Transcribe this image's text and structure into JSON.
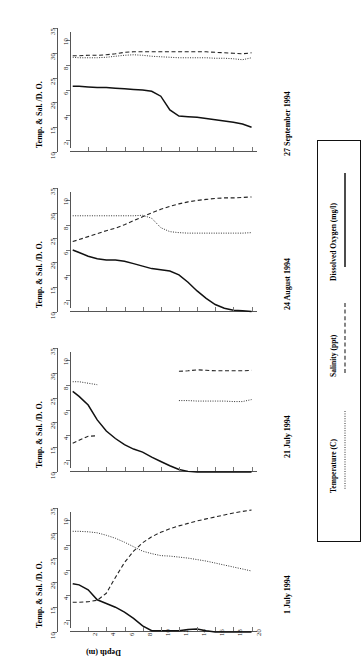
{
  "figure": {
    "y_axis_title": "Temp. & Sal. /D. O.",
    "x_axis_title": "Depth (m)",
    "orientation": "rotated-90",
    "outer_axis_ticks": [
      "10",
      "15",
      "20",
      "25",
      "30",
      "35"
    ],
    "inner_axis_ticks": [
      "2",
      "4",
      "6",
      "8",
      "10"
    ],
    "depth_ticks": [
      "2",
      "4",
      "6",
      "8",
      "10",
      "12",
      "14",
      "16",
      "18",
      "20"
    ]
  },
  "legend": {
    "title": "",
    "items": [
      {
        "label": "Dissolved Oxygen (mg/l)",
        "style": "solid",
        "color": "#111111"
      },
      {
        "label": "Salinity (ppt)",
        "style": "dashed",
        "color": "#222222"
      },
      {
        "label": "Temperature (C)",
        "style": "dotted",
        "color": "#333333"
      }
    ]
  },
  "panels": [
    {
      "date": "27 September 1994"
    },
    {
      "date": "24 August 1994"
    },
    {
      "date": "21 July 1994"
    },
    {
      "date": "1 July 1994"
    }
  ],
  "chart_data": {
    "type": "line",
    "title": "",
    "xlabel": "Depth (m)",
    "ylabel": "Temp. & Sal. /D. O.",
    "xlim": [
      0,
      20
    ],
    "ylim_outer": [
      10,
      35
    ],
    "ylim_inner": [
      1,
      11
    ],
    "grid": false,
    "legend_position": "right",
    "note": "Four depth-profile panels (one per survey date). Dissolved Oxygen read on inner axis (mg/l, 2-10); Salinity and Temperature read on outer axis (10-35).",
    "panels": [
      {
        "date": "27 September 1994",
        "x": [
          0.3,
          1,
          2,
          3,
          4,
          5,
          6,
          7,
          8,
          9,
          10,
          11,
          12,
          13,
          14,
          15,
          16,
          17,
          18,
          19,
          20
        ],
        "series": [
          {
            "name": "Dissolved Oxygen (mg/l)",
            "axis": "inner",
            "values": [
              6.3,
              6.3,
              6.25,
              6.2,
              6.2,
              6.15,
              6.1,
              6.05,
              6.0,
              5.9,
              5.5,
              4.4,
              3.9,
              3.85,
              3.8,
              3.7,
              3.6,
              3.5,
              3.4,
              3.25,
              3.0
            ]
          },
          {
            "name": "Salinity (ppt)",
            "axis": "outer",
            "values": [
              29.4,
              29.4,
              29.5,
              29.5,
              29.6,
              29.8,
              30.1,
              30.2,
              30.2,
              30.2,
              30.2,
              30.2,
              30.2,
              30.2,
              30.2,
              30.2,
              30.1,
              30.0,
              29.9,
              29.8,
              30.0
            ]
          },
          {
            "name": "Temperature (C)",
            "axis": "outer",
            "values": [
              29.1,
              29.0,
              29.0,
              29.0,
              29.1,
              29.3,
              29.5,
              29.6,
              29.5,
              29.3,
              29.2,
              29.1,
              29.0,
              29.0,
              29.0,
              29.0,
              28.9,
              28.9,
              28.8,
              28.6,
              29.0
            ]
          }
        ]
      },
      {
        "date": "24 August 1994",
        "x": [
          0.3,
          1,
          2,
          3,
          4,
          5,
          6,
          7,
          8,
          9,
          10,
          11,
          12,
          13,
          14,
          15,
          16,
          17,
          18,
          19,
          20
        ],
        "series": [
          {
            "name": "Dissolved Oxygen (mg/l)",
            "axis": "inner",
            "values": [
              6.0,
              5.8,
              5.5,
              5.3,
              5.2,
              5.2,
              5.1,
              4.9,
              4.7,
              4.5,
              4.4,
              4.3,
              4.0,
              3.4,
              2.7,
              2.1,
              1.6,
              1.3,
              1.15,
              1.1,
              1.05
            ]
          },
          {
            "name": "Salinity (ppt)",
            "axis": "outer",
            "values": [
              24.2,
              24.6,
              25.2,
              25.8,
              26.4,
              26.9,
              27.6,
              28.4,
              29.2,
              30.0,
              30.7,
              31.3,
              31.8,
              32.2,
              32.5,
              32.7,
              32.9,
              33.0,
              33.0,
              33.1,
              33.2
            ]
          },
          {
            "name": "Temperature (C)",
            "axis": "outer",
            "values": [
              29.4,
              29.4,
              29.4,
              29.4,
              29.4,
              29.4,
              29.4,
              29.4,
              29.5,
              28.9,
              27.0,
              26.2,
              26.0,
              25.9,
              25.9,
              25.9,
              25.9,
              25.9,
              25.9,
              25.9,
              26.0
            ]
          }
        ]
      },
      {
        "date": "21 July 1994",
        "x": [
          0.3,
          1,
          2,
          3,
          4,
          5,
          6,
          7,
          8,
          9,
          10,
          11,
          12,
          13,
          14,
          15,
          16,
          17,
          18,
          19,
          20
        ],
        "series": [
          {
            "name": "Dissolved Oxygen (mg/l)",
            "axis": "inner",
            "values": [
              7.5,
              7.1,
              6.4,
              5.2,
              4.3,
              3.7,
              3.2,
              2.85,
              2.6,
              2.2,
              1.85,
              1.5,
              1.2,
              1.05,
              1.0,
              1.0,
              1.0,
              1.0,
              1.0,
              1.0,
              1.0
            ]
          },
          {
            "name": "Salinity (ppt)",
            "axis": "outer",
            "values": [
              15.8,
              16.4,
              17.2,
              17.3,
              null,
              null,
              null,
              null,
              null,
              null,
              null,
              null,
              30.3,
              30.4,
              30.6,
              30.5,
              30.4,
              30.4,
              30.4,
              30.4,
              30.5
            ]
          },
          {
            "name": "Temperature (C)",
            "axis": "outer",
            "values": [
              28.2,
              28.2,
              27.9,
              27.6,
              null,
              null,
              null,
              null,
              null,
              null,
              null,
              null,
              24.4,
              24.4,
              24.3,
              24.3,
              24.3,
              24.3,
              24.2,
              24.2,
              24.6
            ]
          }
        ]
      },
      {
        "date": "1 July 1994",
        "x": [
          0.3,
          1,
          2,
          3,
          4,
          5,
          6,
          7,
          8,
          9,
          10,
          11,
          12,
          13,
          14,
          15,
          16,
          17,
          18,
          19,
          20
        ],
        "series": [
          {
            "name": "Dissolved Oxygen (mg/l)",
            "axis": "inner",
            "values": [
              4.9,
              4.8,
              4.4,
              3.6,
              3.3,
              3.0,
              2.6,
              2.1,
              1.5,
              1.1,
              1.1,
              1.1,
              1.1,
              1.2,
              1.25,
              1.1,
              1.0,
              1.0,
              1.0,
              1.0,
              1.0
            ]
          },
          {
            "name": "Salinity (ppt)",
            "axis": "outer",
            "values": [
              16.0,
              16.0,
              16.1,
              16.4,
              17.8,
              21.0,
              24.0,
              26.3,
              28.0,
              29.2,
              30.1,
              30.8,
              31.4,
              31.9,
              32.4,
              32.8,
              33.2,
              33.6,
              34.0,
              34.3,
              34.6
            ]
          },
          {
            "name": "Temperature (C)",
            "axis": "outer",
            "values": [
              30.3,
              30.3,
              30.2,
              30.0,
              29.5,
              28.9,
              28.1,
              27.2,
              26.3,
              25.8,
              25.4,
              25.3,
              25.1,
              24.9,
              24.6,
              24.3,
              23.9,
              23.5,
              23.1,
              22.7,
              22.3
            ]
          }
        ]
      }
    ]
  }
}
